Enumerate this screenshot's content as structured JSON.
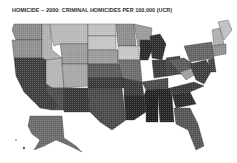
{
  "title": "HOMICIDE -- 2000: CRIMINAL HOMICIDES PER 100,000 (UCR)",
  "map": {
    "type": "choropleth",
    "region": "United States (states)",
    "shading": "grayscale halftone; darker = higher rate",
    "colors": {
      "lightest": "#c8c8c8",
      "light": "#a8a8a8",
      "medium": "#7a7a7a",
      "dark": "#4a4a4a",
      "darkest": "#222222"
    }
  }
}
